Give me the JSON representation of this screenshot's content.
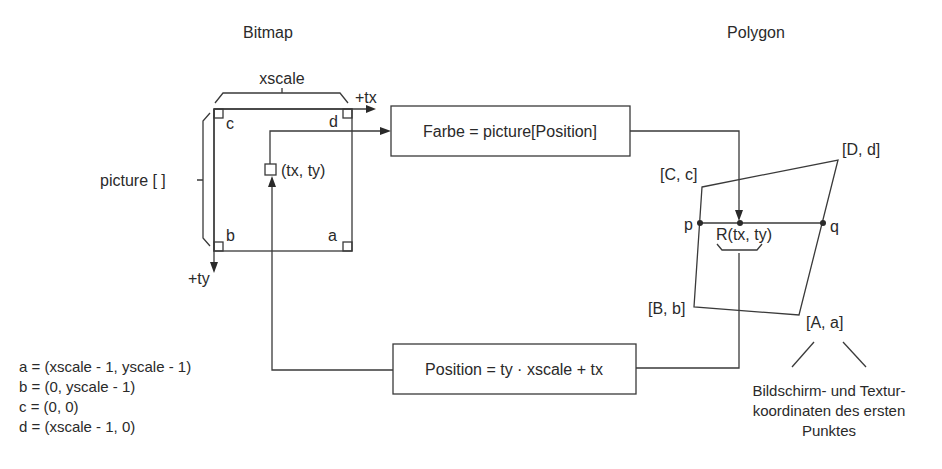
{
  "titles": {
    "bitmap": "Bitmap",
    "polygon": "Polygon"
  },
  "bitmap": {
    "xscale_label": "xscale",
    "picture_label": "picture [ ]",
    "tx_axis": "+tx",
    "ty_axis": "+ty",
    "corner_a": "a",
    "corner_b": "b",
    "corner_c": "c",
    "corner_d": "d",
    "point_label": "(tx, ty)"
  },
  "boxes": {
    "farbe": "Farbe = picture[Position]",
    "position": "Position = ty · xscale + tx"
  },
  "polygon": {
    "corner_A": "[A, a]",
    "corner_B": "[B, b]",
    "corner_C": "[C, c]",
    "corner_D": "[D, d]",
    "point_p": "p",
    "point_q": "q",
    "point_R": "R(tx, ty)",
    "note_lines": [
      "Bildschirm- und Textur-",
      "koordinaten des ersten",
      "Punktes"
    ]
  },
  "definitions": [
    "a = (xscale - 1, yscale - 1)",
    "b = (0, yscale - 1)",
    "c = (0, 0)",
    "d = (xscale - 1, 0)"
  ],
  "colors": {
    "line": "#3a3a3a",
    "text": "#2a2a2a",
    "background": "#ffffff"
  }
}
